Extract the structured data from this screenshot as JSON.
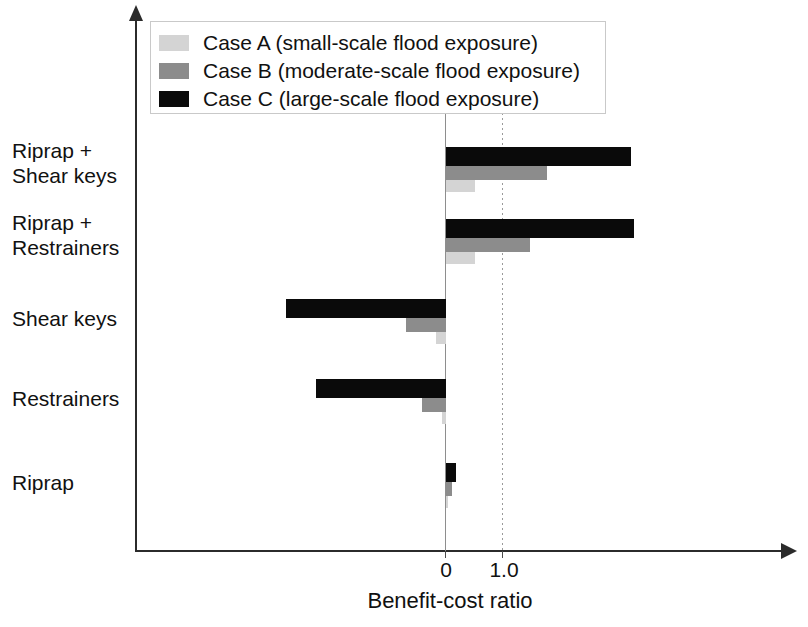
{
  "chart_data": {
    "type": "bar",
    "orientation": "horizontal",
    "title": "",
    "xlabel": "Benefit-cost ratio",
    "ylabel": "",
    "categories": [
      "Riprap + Shear keys",
      "Riprap + Restrainers",
      "Shear keys",
      "Restrainers",
      "Riprap"
    ],
    "category_lines": [
      [
        "Riprap +",
        "Shear keys"
      ],
      [
        "Riprap +",
        "Restrainers"
      ],
      [
        "Shear keys"
      ],
      [
        "Restrainers"
      ],
      [
        "Riprap"
      ]
    ],
    "series": [
      {
        "name": "Case A (small-scale flood exposure)",
        "color": "#d4d4d4",
        "values": [
          0.52,
          0.52,
          -0.18,
          -0.07,
          0.04
        ]
      },
      {
        "name": "Case B (moderate-scale flood exposure)",
        "color": "#8c8c8c",
        "values": [
          1.8,
          1.5,
          -0.71,
          -0.43,
          0.11
        ]
      },
      {
        "name": "Case C (large-scale flood exposure)",
        "color": "#0a0a0a",
        "values": [
          3.3,
          3.36,
          -2.86,
          -2.32,
          0.18
        ]
      }
    ],
    "xticks": [
      0,
      1.0
    ],
    "xtick_labels": [
      "0",
      "1.0"
    ],
    "xlim": [
      -3.2,
      4.3
    ],
    "grid": false,
    "reference_lines": [
      {
        "value": 0,
        "style": "solid",
        "color": "#8e8e8e"
      },
      {
        "value": 1.0,
        "style": "dotted",
        "color": "#9a9a9a"
      }
    ],
    "legend_position": "top-left"
  },
  "legend": {
    "items": [
      {
        "label": "Case A (small-scale flood exposure)",
        "color": "#d4d4d4"
      },
      {
        "label": "Case B (moderate-scale flood exposure)",
        "color": "#8c8c8c"
      },
      {
        "label": "Case C (large-scale flood exposure)",
        "color": "#0a0a0a"
      }
    ]
  },
  "axis": {
    "x_title": "Benefit-cost ratio",
    "tick_0": "0",
    "tick_1": "1.0"
  }
}
